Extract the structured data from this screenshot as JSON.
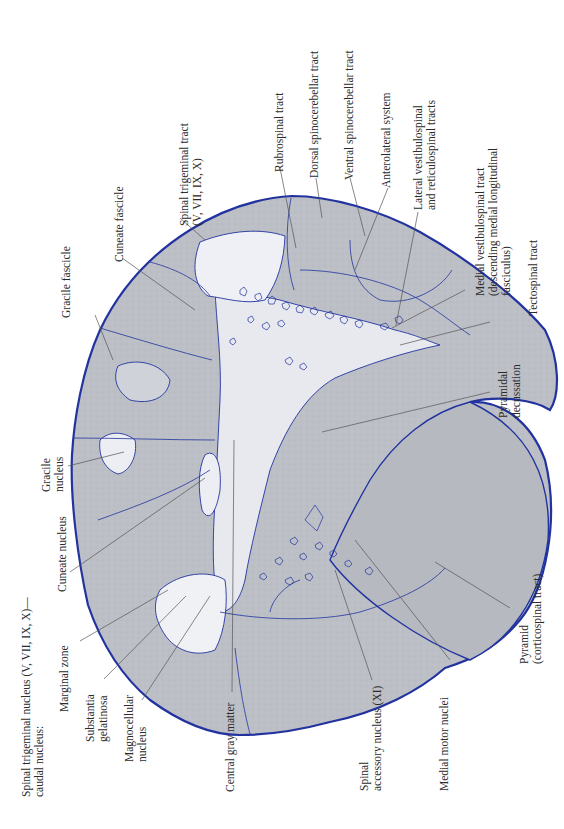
{
  "figure": {
    "orientation": "rotated 90 degrees counter-clockwise",
    "colors": {
      "outline": "#2233a0",
      "white_matter": "#b9bcc2",
      "gray_matter": "#e6e8ee",
      "leader_line": "#555555",
      "background": "#ffffff"
    }
  },
  "labels": {
    "spinal_trigeminal_tract": {
      "line1": "Spinal trigeminal tract",
      "line2": "(V, VII, IX, X)"
    },
    "cuneate_fascicle": {
      "line1": "Cuneate fascicle"
    },
    "rubrospinal_tract": {
      "line1": "Rubrospinal tract"
    },
    "dorsal_spinocerebellar_tract": {
      "line1": "Dorsal spinocerebellar tract"
    },
    "ventral_spinocerebellar_tract": {
      "line1": "Ventral spinocerebellar tract"
    },
    "anterolateral_system": {
      "line1": "Anterolateral system"
    },
    "lateral_vestibulospinal": {
      "line1": "Lateral vestibulospinal",
      "line2": "and reticulospinal tracts"
    },
    "medial_vestibulospinal": {
      "line1": "Medial vestibulospinal tract",
      "line2": "(descending medial longitudinal",
      "line3": "fasciculus)"
    },
    "tectospinal_tract": {
      "line1": "Tectospinal tract"
    },
    "gracile_fascicle": {
      "line1": "Gracile fascicle"
    },
    "gracile_nucleus": {
      "line1": "Gracile",
      "line2": "nucleus"
    },
    "pyramidal_decussation": {
      "line1": "Pyramidal",
      "line2": "decussation"
    },
    "cuneate_nucleus": {
      "line1": "Cuneate nucleus"
    },
    "pyramid": {
      "line1": "Pyramid",
      "line2": "(corticospinal tract)"
    },
    "spinal_trigeminal_nucleus": {
      "line1": "Spinal trigeminal nucleus  (V, VII, IX, X)—",
      "line2": "caudal nucleus:"
    },
    "marginal_zone": {
      "line1": "Marginal zone"
    },
    "substantia_gelatinosa": {
      "line1": "Substantia",
      "line2": "gelatinosa"
    },
    "magnocellular_nucleus": {
      "line1": "Magnocellular",
      "line2": "nucleus"
    },
    "central_gray_matter": {
      "line1": "Central gray matter"
    },
    "spinal_accessory_nucleus": {
      "line1": "Spinal",
      "line2": "accessory nucleus (XI)"
    },
    "medial_motor_nuclei": {
      "line1": "Medial motor nuclei"
    }
  }
}
